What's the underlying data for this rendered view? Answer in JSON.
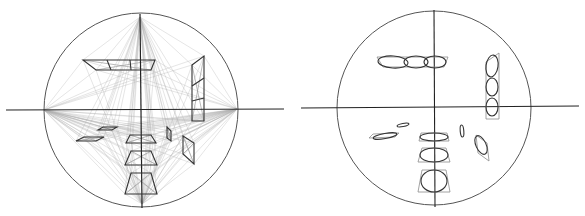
{
  "figure": {
    "colors": {
      "background": "#ffffff",
      "axis": "#222222",
      "circle": "#555555",
      "construction": "#b0b0b0",
      "shape": "#333333",
      "ellipse": "#333333",
      "guide": "#8c8c8c"
    }
  },
  "left_panel": {
    "title": "perspective-construction",
    "circle": {
      "cx": 141,
      "cy": 110,
      "r": 97
    },
    "h_axis": {
      "x1": 6,
      "y1": 110,
      "x2": 284,
      "y2": 109
    },
    "v_axis": {
      "x1": 140,
      "y1": 14,
      "x2": 142,
      "y2": 208
    },
    "vanishing_points": [
      {
        "name": "left",
        "x": 44,
        "y": 110
      },
      {
        "name": "right",
        "x": 237,
        "y": 109
      },
      {
        "name": "top",
        "x": 140,
        "y": 17
      },
      {
        "name": "bottom",
        "x": 142,
        "y": 204
      },
      {
        "name": "center",
        "x": 141,
        "y": 110
      }
    ],
    "shapes": [
      {
        "name": "top-strip",
        "points": [
          [
            83,
            60
          ],
          [
            155,
            60
          ],
          [
            151,
            70
          ],
          [
            96,
            70
          ]
        ],
        "dividers": [
          [
            107,
            60,
            111,
            70
          ],
          [
            130,
            60,
            131,
            70
          ]
        ]
      },
      {
        "name": "right-strip",
        "points": [
          [
            192,
            65
          ],
          [
            204,
            56
          ],
          [
            204,
            121
          ],
          [
            192,
            121
          ]
        ],
        "dividers": [
          [
            192,
            86,
            204,
            78
          ],
          [
            192,
            101,
            204,
            98
          ]
        ]
      },
      {
        "name": "bottom-trap-1",
        "points": [
          [
            130,
            135
          ],
          [
            151,
            135
          ],
          [
            156,
            143
          ],
          [
            126,
            143
          ]
        ]
      },
      {
        "name": "bottom-trap-2",
        "points": [
          [
            131,
            151
          ],
          [
            151,
            151
          ],
          [
            157,
            165
          ],
          [
            125,
            165
          ]
        ]
      },
      {
        "name": "bottom-trap-3",
        "points": [
          [
            131,
            173
          ],
          [
            151,
            173
          ],
          [
            157,
            194
          ],
          [
            125,
            194
          ]
        ]
      },
      {
        "name": "left-parallelogram-1",
        "points": [
          [
            103,
            127
          ],
          [
            117,
            127
          ],
          [
            112,
            130
          ],
          [
            98,
            130
          ]
        ]
      },
      {
        "name": "left-parallelogram-2",
        "points": [
          [
            84,
            137
          ],
          [
            104,
            137
          ],
          [
            96,
            141
          ],
          [
            76,
            141
          ]
        ]
      },
      {
        "name": "small-right-quad",
        "points": [
          [
            167,
            127
          ],
          [
            171,
            131
          ],
          [
            171,
            141
          ],
          [
            167,
            138
          ]
        ]
      },
      {
        "name": "right-quad",
        "points": [
          [
            183,
            136
          ],
          [
            194,
            143
          ],
          [
            194,
            164
          ],
          [
            183,
            154
          ]
        ]
      }
    ]
  },
  "right_panel": {
    "title": "inscribed-ellipses",
    "circle": {
      "cx": 141,
      "cy": 108,
      "r": 97
    },
    "h_axis": {
      "x1": 8,
      "y1": 108,
      "x2": 286,
      "y2": 106
    },
    "v_axis": {
      "x1": 141,
      "y1": 10,
      "x2": 142,
      "y2": 207
    },
    "ellipses": [
      {
        "name": "top-row-ellipse-1",
        "cx": 100,
        "cy": 62,
        "rx": 15,
        "ry": 6,
        "rotate": 4
      },
      {
        "name": "top-row-ellipse-2",
        "cx": 123,
        "cy": 62,
        "rx": 12,
        "ry": 6,
        "rotate": 0
      },
      {
        "name": "top-row-ellipse-3",
        "cx": 142,
        "cy": 62,
        "rx": 11,
        "ry": 6,
        "rotate": 0
      },
      {
        "name": "right-col-ellipse-1",
        "cx": 199,
        "cy": 66,
        "rx": 6,
        "ry": 11,
        "rotate": 8
      },
      {
        "name": "right-col-ellipse-2",
        "cx": 199,
        "cy": 87,
        "rx": 6,
        "ry": 9,
        "rotate": 0
      },
      {
        "name": "right-col-ellipse-3",
        "cx": 199,
        "cy": 107,
        "rx": 6,
        "ry": 9,
        "rotate": 0
      },
      {
        "name": "left-ellipse-small",
        "cx": 110,
        "cy": 125,
        "rx": 6,
        "ry": 1.6,
        "rotate": -10
      },
      {
        "name": "left-ellipse-large",
        "cx": 92,
        "cy": 136,
        "rx": 12,
        "ry": 2.6,
        "rotate": -10
      },
      {
        "name": "bottom-ellipse-1",
        "cx": 141,
        "cy": 137,
        "rx": 14,
        "ry": 4,
        "rotate": 0
      },
      {
        "name": "bottom-ellipse-2",
        "cx": 141,
        "cy": 155,
        "rx": 14,
        "ry": 7,
        "rotate": 0
      },
      {
        "name": "bottom-ellipse-3",
        "cx": 141,
        "cy": 181,
        "rx": 13,
        "ry": 11,
        "rotate": 0
      },
      {
        "name": "small-right-ellipse",
        "cx": 169,
        "cy": 131,
        "rx": 1.8,
        "ry": 6,
        "rotate": -5
      },
      {
        "name": "right-ellipse",
        "cx": 188,
        "cy": 145,
        "rx": 5,
        "ry": 10,
        "rotate": -25
      }
    ],
    "frames": [
      {
        "name": "top-row-frame",
        "points": [
          [
            84,
            57
          ],
          [
            155,
            57
          ],
          [
            151,
            67
          ],
          [
            90,
            67
          ]
        ]
      },
      {
        "name": "right-col-frame",
        "points": [
          [
            193,
            62
          ],
          [
            206,
            53
          ],
          [
            206,
            119
          ],
          [
            193,
            119
          ]
        ]
      },
      {
        "name": "bottom-frame-1",
        "points": [
          [
            128,
            133
          ],
          [
            154,
            133
          ],
          [
            156,
            141
          ],
          [
            126,
            141
          ]
        ]
      },
      {
        "name": "bottom-frame-2",
        "points": [
          [
            129,
            148
          ],
          [
            153,
            148
          ],
          [
            157,
            162
          ],
          [
            125,
            162
          ]
        ]
      },
      {
        "name": "bottom-frame-3",
        "points": [
          [
            129,
            170
          ],
          [
            153,
            170
          ],
          [
            157,
            192
          ],
          [
            125,
            192
          ]
        ]
      },
      {
        "name": "left-frame",
        "points": [
          [
            80,
            134
          ],
          [
            106,
            133
          ],
          [
            102,
            137
          ],
          [
            76,
            138
          ]
        ]
      },
      {
        "name": "right-frame",
        "points": [
          [
            183,
            135
          ],
          [
            194,
            143
          ],
          [
            196,
            161
          ],
          [
            185,
            153
          ]
        ]
      }
    ]
  }
}
